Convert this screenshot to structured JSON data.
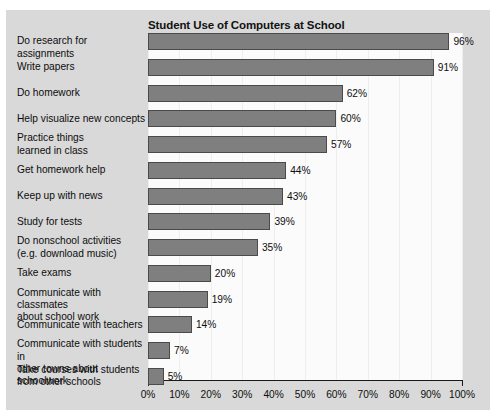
{
  "chart_data": {
    "type": "bar",
    "orientation": "horizontal",
    "title": "Student Use of Computers at School",
    "xlabel": "",
    "ylabel": "",
    "xlim": [
      0,
      100
    ],
    "xticks": [
      "0%",
      "10%",
      "20%",
      "30%",
      "40%",
      "50%",
      "60%",
      "70%",
      "80%",
      "90%",
      "100%"
    ],
    "grid": "vertical",
    "legend": "none",
    "value_suffix": "%",
    "categories": [
      "Do research for assignments",
      "Write papers",
      "Do homework",
      "Help visualize new concepts",
      "Practice things\nlearned in class",
      "Get homework help",
      "Keep up with news",
      "Study for tests",
      "Do nonschool activities\n(e.g. download music)",
      "Take exams",
      "Communicate with classmates\nabout school work",
      "Communicate with teachers",
      "Communicate with students in\nother towns about schoolwork",
      "Take courses with students\nfrom other schools"
    ],
    "values": [
      96,
      91,
      62,
      60,
      57,
      44,
      43,
      39,
      35,
      20,
      19,
      14,
      7,
      5
    ],
    "value_labels": [
      "96%",
      "91%",
      "62%",
      "60%",
      "57%",
      "44%",
      "43%",
      "39%",
      "35%",
      "20%",
      "19%",
      "14%",
      "7%",
      "5%"
    ]
  },
  "colors": {
    "panel_background": "#d9d9d9",
    "plot_background": "#fbfbfb",
    "bar_fill": "#7f7f7f",
    "bar_border": "#4a4a4a",
    "axis": "#1a1a1a",
    "gridline": "#eeeeee",
    "text": "#0d0d0d"
  }
}
